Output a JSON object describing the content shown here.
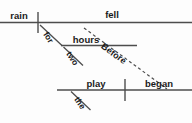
{
  "diagram": {
    "type": "reed-kellogg-sentence-diagram",
    "sentence": "Before the rain fell for two hours, the play began.",
    "canvas": {
      "width": 192,
      "height": 123,
      "background": "#fdfdfd"
    },
    "colors": {
      "line": "#4d4d4d",
      "text": "#1a1a1a",
      "dashed_line": "#4d4d4d"
    },
    "clauses": [
      {
        "name": "subordinate-clause",
        "baseline": {
          "x1": 0,
          "y1": 22.5,
          "x2": 192,
          "y2": 22.5
        },
        "divider": {
          "x": 38,
          "y1": 12,
          "y2": 33
        },
        "subject": {
          "label": "rain",
          "x": 19,
          "y": 19
        },
        "verb": {
          "label": "fell",
          "x": 112,
          "y": 17
        }
      },
      {
        "name": "main-clause",
        "baseline": {
          "x1": 57,
          "y1": 90,
          "x2": 192,
          "y2": 90
        },
        "divider": {
          "x": 125,
          "y1": 79,
          "y2": 101
        },
        "subject": {
          "label": "play",
          "x": 95,
          "y": 86
        },
        "verb": {
          "label": "began",
          "x": 158,
          "y": 85
        }
      }
    ],
    "modifiers": [
      {
        "label": "for",
        "role": "preposition",
        "attach": "verb-fell",
        "line": {
          "x1": 40,
          "y1": 25,
          "x2": 62,
          "y2": 46
        },
        "text_x": 46,
        "text_y": 39,
        "rotation": 57
      },
      {
        "label": "hours",
        "role": "object-of-preposition",
        "line": {
          "x1": 61,
          "y1": 45.5,
          "x2": 137,
          "y2": 45.5
        },
        "text_x": 86,
        "text_y": 42
      },
      {
        "label": "two",
        "role": "adjective",
        "attach": "hours",
        "line": {
          "x1": 63,
          "y1": 47,
          "x2": 82,
          "y2": 65
        },
        "text_x": 69,
        "text_y": 60,
        "rotation": 57
      },
      {
        "label": "the",
        "role": "article",
        "attach": "play",
        "line": {
          "x1": 71,
          "y1": 91,
          "x2": 90,
          "y2": 110
        },
        "text_x": 77,
        "text_y": 105,
        "rotation": 57
      }
    ],
    "connectors": [
      {
        "label": "Before",
        "role": "subordinating-conjunction",
        "style": "dashed",
        "line": {
          "x1": 84,
          "y1": 28,
          "x2": 166,
          "y2": 88
        },
        "text_x": 112,
        "text_y": 58,
        "rotation": 36,
        "dash": "3 2.6"
      }
    ],
    "labels_list": [
      "rain",
      "fell",
      "for",
      "hours",
      "two",
      "Before",
      "play",
      "the",
      "began"
    ]
  }
}
